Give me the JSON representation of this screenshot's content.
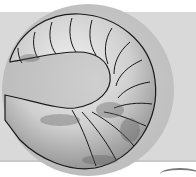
{
  "image": {
    "subject": "segmented grub / worm illustration curled in a circle",
    "colors": {
      "background": "#ffffff",
      "band": "#d9d9d9",
      "circle": "#bdbdbd",
      "body_light": "#e8e8e8",
      "body_shadow": "#8a8a8a",
      "outline": "#1a1a1a"
    }
  }
}
